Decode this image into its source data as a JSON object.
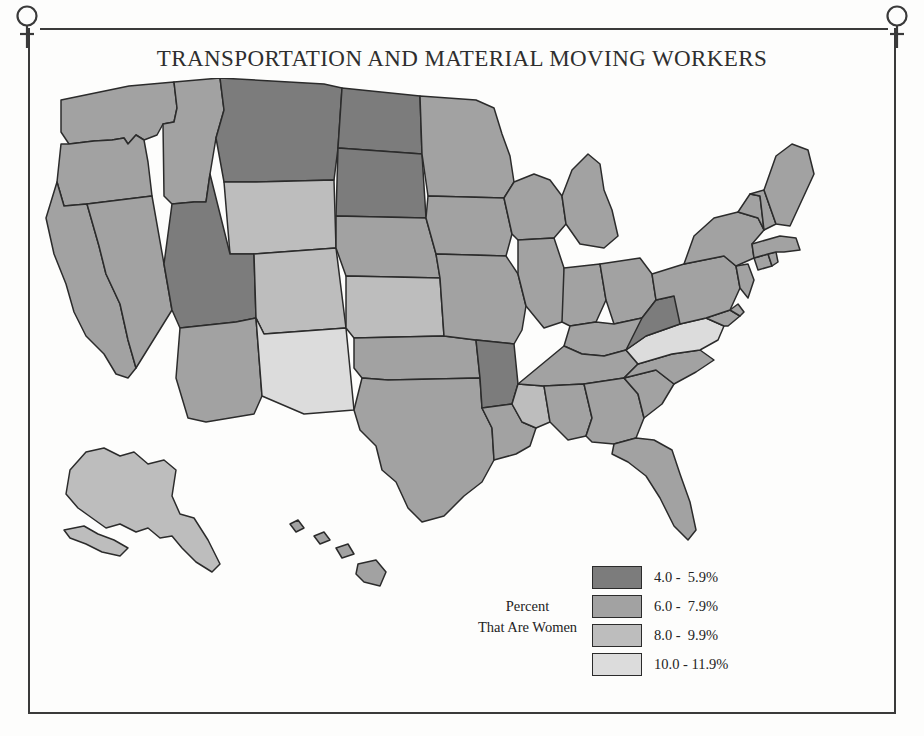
{
  "title": "TRANSPORTATION AND MATERIAL MOVING WORKERS",
  "legend": {
    "caption_line1": "Percent",
    "caption_line2": "That Are Women",
    "classes": [
      {
        "label": "4.0 -  5.9%",
        "color": "#7c7c7c",
        "min": 4.0,
        "max": 5.9
      },
      {
        "label": "6.0 -  7.9%",
        "color": "#a2a2a2",
        "min": 6.0,
        "max": 7.9
      },
      {
        "label": "8.0 -  9.9%",
        "color": "#bdbdbd",
        "min": 8.0,
        "max": 9.9
      },
      {
        "label": "10.0 - 11.9%",
        "color": "#dcdcdc",
        "min": 10.0,
        "max": 11.9
      }
    ]
  },
  "decoration": {
    "corner_icon": "venus-symbol",
    "frame_color": "#3a3a3a"
  },
  "chart_data": {
    "type": "choropleth-map",
    "title": "TRANSPORTATION AND MATERIAL MOVING WORKERS",
    "value_label": "Percent That Are Women",
    "unit": "%",
    "legend_position": "bottom-center",
    "bins": [
      {
        "label": "4.0 -  5.9%",
        "color": "#7c7c7c"
      },
      {
        "label": "6.0 -  7.9%",
        "color": "#a2a2a2"
      },
      {
        "label": "8.0 -  9.9%",
        "color": "#bdbdbd"
      },
      {
        "label": "10.0 - 11.9%",
        "color": "#dcdcdc"
      }
    ],
    "regions": [
      {
        "code": "WA",
        "name": "Washington",
        "bin": 1
      },
      {
        "code": "OR",
        "name": "Oregon",
        "bin": 1
      },
      {
        "code": "CA",
        "name": "California",
        "bin": 1
      },
      {
        "code": "NV",
        "name": "Nevada",
        "bin": 1
      },
      {
        "code": "ID",
        "name": "Idaho",
        "bin": 1
      },
      {
        "code": "MT",
        "name": "Montana",
        "bin": 0
      },
      {
        "code": "WY",
        "name": "Wyoming",
        "bin": 2
      },
      {
        "code": "UT",
        "name": "Utah",
        "bin": 0
      },
      {
        "code": "AZ",
        "name": "Arizona",
        "bin": 1
      },
      {
        "code": "CO",
        "name": "Colorado",
        "bin": 2
      },
      {
        "code": "NM",
        "name": "New Mexico",
        "bin": 3
      },
      {
        "code": "ND",
        "name": "North Dakota",
        "bin": 0
      },
      {
        "code": "SD",
        "name": "South Dakota",
        "bin": 0
      },
      {
        "code": "NE",
        "name": "Nebraska",
        "bin": 1
      },
      {
        "code": "KS",
        "name": "Kansas",
        "bin": 2
      },
      {
        "code": "OK",
        "name": "Oklahoma",
        "bin": 1
      },
      {
        "code": "TX",
        "name": "Texas",
        "bin": 1
      },
      {
        "code": "MN",
        "name": "Minnesota",
        "bin": 1
      },
      {
        "code": "IA",
        "name": "Iowa",
        "bin": 1
      },
      {
        "code": "MO",
        "name": "Missouri",
        "bin": 1
      },
      {
        "code": "AR",
        "name": "Arkansas",
        "bin": 0
      },
      {
        "code": "LA",
        "name": "Louisiana",
        "bin": 1
      },
      {
        "code": "WI",
        "name": "Wisconsin",
        "bin": 1
      },
      {
        "code": "IL",
        "name": "Illinois",
        "bin": 1
      },
      {
        "code": "MS",
        "name": "Mississippi",
        "bin": 2
      },
      {
        "code": "MI",
        "name": "Michigan",
        "bin": 1
      },
      {
        "code": "IN",
        "name": "Indiana",
        "bin": 1
      },
      {
        "code": "OH",
        "name": "Ohio",
        "bin": 1
      },
      {
        "code": "KY",
        "name": "Kentucky",
        "bin": 1
      },
      {
        "code": "TN",
        "name": "Tennessee",
        "bin": 1
      },
      {
        "code": "AL",
        "name": "Alabama",
        "bin": 1
      },
      {
        "code": "GA",
        "name": "Georgia",
        "bin": 1
      },
      {
        "code": "FL",
        "name": "Florida",
        "bin": 1
      },
      {
        "code": "SC",
        "name": "South Carolina",
        "bin": 1
      },
      {
        "code": "NC",
        "name": "North Carolina",
        "bin": 1
      },
      {
        "code": "VA",
        "name": "Virginia",
        "bin": 3
      },
      {
        "code": "WV",
        "name": "West Virginia",
        "bin": 0
      },
      {
        "code": "MD",
        "name": "Maryland",
        "bin": 1
      },
      {
        "code": "DE",
        "name": "Delaware",
        "bin": 1
      },
      {
        "code": "PA",
        "name": "Pennsylvania",
        "bin": 1
      },
      {
        "code": "NJ",
        "name": "New Jersey",
        "bin": 1
      },
      {
        "code": "NY",
        "name": "New York",
        "bin": 1
      },
      {
        "code": "CT",
        "name": "Connecticut",
        "bin": 1
      },
      {
        "code": "RI",
        "name": "Rhode Island",
        "bin": 1
      },
      {
        "code": "MA",
        "name": "Massachusetts",
        "bin": 1
      },
      {
        "code": "VT",
        "name": "Vermont",
        "bin": 1
      },
      {
        "code": "NH",
        "name": "New Hampshire",
        "bin": 1
      },
      {
        "code": "ME",
        "name": "Maine",
        "bin": 1
      },
      {
        "code": "AK",
        "name": "Alaska",
        "bin": 2
      },
      {
        "code": "HI",
        "name": "Hawaii",
        "bin": 1
      }
    ]
  }
}
